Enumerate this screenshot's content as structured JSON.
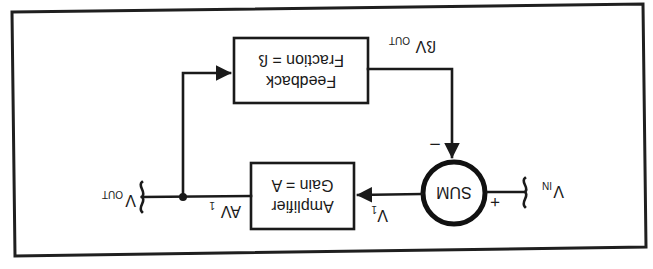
{
  "diagram": {
    "orientation": "rotated 180 degrees",
    "blocks": {
      "feedback": {
        "line1": "Feedback",
        "line2": "Fraction = ß"
      },
      "amplifier": {
        "line1": "Amplifier",
        "line2": "Gain = A"
      },
      "sum": {
        "label": "SUM"
      }
    },
    "signals": {
      "vin": {
        "main": "V",
        "sub": "IN"
      },
      "vout": {
        "main": "V",
        "sub": "OUT"
      },
      "v1": {
        "main": "V",
        "sub": "1"
      },
      "av1": {
        "main": "AV",
        "sub": "1"
      },
      "beta_vout": {
        "main": "ßV",
        "sub": "OUT"
      }
    },
    "signs": {
      "plus": "+",
      "minus": "–"
    },
    "edges": [
      {
        "from": "V_IN",
        "to": "SUM",
        "sign": "+"
      },
      {
        "from": "SUM",
        "to": "Amplifier",
        "label": "V1"
      },
      {
        "from": "Amplifier",
        "to": "V_OUT",
        "label": "AV1"
      },
      {
        "from": "V_OUT",
        "to": "Feedback"
      },
      {
        "from": "Feedback",
        "to": "SUM",
        "label": "ßV_OUT",
        "sign": "–"
      }
    ],
    "colors": {
      "ink": "#1a1a1a",
      "background": "#ffffff"
    }
  }
}
